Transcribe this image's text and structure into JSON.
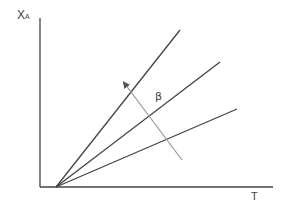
{
  "diagram": {
    "y_axis_label_main": "X",
    "y_axis_label_sub": "A",
    "x_axis_label": "T",
    "arrow_label": "β",
    "line_color": "#444444",
    "arrow_color": "#888888",
    "lines": [
      {
        "name": "line-steep",
        "from": [
          56,
          187
        ],
        "to": [
          180,
          30
        ]
      },
      {
        "name": "line-middle",
        "from": [
          56,
          187
        ],
        "to": [
          220,
          62
        ]
      },
      {
        "name": "line-shallow",
        "from": [
          56,
          187
        ],
        "to": [
          237,
          109
        ]
      }
    ],
    "arrow": {
      "from": [
        182,
        160
      ],
      "to": [
        123,
        81
      ],
      "meaning": "increasing β"
    }
  }
}
